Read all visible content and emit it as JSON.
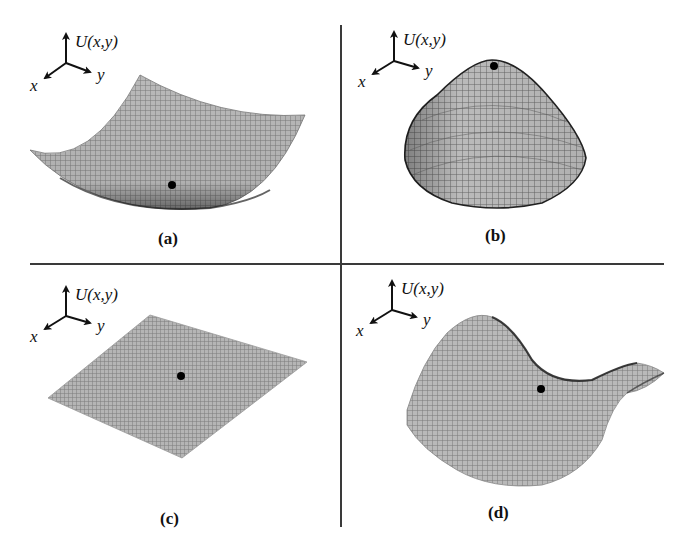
{
  "figure": {
    "panels": [
      {
        "id": "a",
        "label": "(a)",
        "surface_type": "minimum (bowl)",
        "axis_labels": {
          "vertical": "U(x,y)",
          "x": "x",
          "y": "y"
        },
        "marker": "point at surface minimum"
      },
      {
        "id": "b",
        "label": "(b)",
        "surface_type": "maximum (dome)",
        "axis_labels": {
          "vertical": "U(x,y)",
          "x": "x",
          "y": "y"
        },
        "marker": "point at surface maximum"
      },
      {
        "id": "c",
        "label": "(c)",
        "surface_type": "flat plane",
        "axis_labels": {
          "vertical": "U(x,y)",
          "x": "x",
          "y": "y"
        },
        "marker": "point on flat surface"
      },
      {
        "id": "d",
        "label": "(d)",
        "surface_type": "saddle",
        "axis_labels": {
          "vertical": "U(x,y)",
          "x": "x",
          "y": "y"
        },
        "marker": "point at saddle point"
      }
    ],
    "colors": {
      "mesh": "#8a8a8a",
      "mesh_dark": "#3c3c3c",
      "marker": "#000000",
      "divider": "#3a3a3a"
    }
  }
}
